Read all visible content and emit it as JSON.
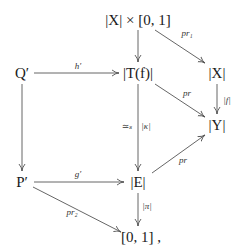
{
  "diagram": {
    "type": "commutative-diagram",
    "nodes": {
      "XxI": "|X| × [0, 1]",
      "Qp": "Q′",
      "Tf": "|T(f)|",
      "X": "|X|",
      "Y": "|Y|",
      "Pp": "P′",
      "E": "|E|",
      "I": "[0, 1] ,"
    },
    "labels": {
      "h_prime": "h′",
      "pr1": "pr₁",
      "pr_top": "pr",
      "f": "|f|",
      "simeq_s": "≃ₛ",
      "kappa": "|κ|",
      "pr_bottom": "pr",
      "g_prime": "g′",
      "pi": "|π|",
      "pr2": "pr₂"
    },
    "edges": [
      {
        "from": "XxI",
        "to": "Tf",
        "label": ""
      },
      {
        "from": "XxI",
        "to": "X",
        "label": "pr1"
      },
      {
        "from": "Qp",
        "to": "Tf",
        "label": "h_prime"
      },
      {
        "from": "Tf",
        "to": "Y",
        "label": "pr_top"
      },
      {
        "from": "X",
        "to": "Y",
        "label": "f"
      },
      {
        "from": "Qp",
        "to": "Pp",
        "label": ""
      },
      {
        "from": "Tf",
        "to": "E",
        "label": "kappa",
        "left_label": "simeq_s"
      },
      {
        "from": "E",
        "to": "Y",
        "label": "pr_bottom"
      },
      {
        "from": "Pp",
        "to": "E",
        "label": "g_prime"
      },
      {
        "from": "E",
        "to": "I",
        "label": "pi"
      },
      {
        "from": "Pp",
        "to": "I",
        "label": "pr2"
      }
    ],
    "colors": {
      "line": "#555555",
      "text": "#1a1a1a",
      "background": "#ffffff"
    }
  }
}
